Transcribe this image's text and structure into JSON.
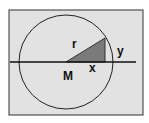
{
  "diagram": {
    "colors": {
      "background": "#ffffff",
      "panel": "#e2e2e2",
      "stroke": "#222222",
      "triangle_fill": "#7a7a7a"
    },
    "labels": {
      "radius": "r",
      "vertical_leg": "y",
      "horizontal_leg": "x",
      "center": "M"
    }
  }
}
